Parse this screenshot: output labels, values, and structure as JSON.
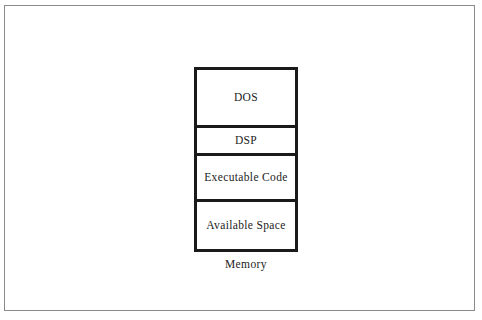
{
  "figure": {
    "caption": "Memory",
    "border_color": "#8a8a8a",
    "background_color": "#ffffff"
  },
  "memory_diagram": {
    "name": "memory-map",
    "box_border_color": "#1a1a1a",
    "text_color": "#1c1c1c",
    "segments": [
      {
        "label": "DOS",
        "height_px": 58,
        "order": 1
      },
      {
        "label": "DSP",
        "height_px": 28,
        "order": 2
      },
      {
        "label": "Executable Code",
        "height_px": 46,
        "order": 3
      },
      {
        "label": "Available Space",
        "height_px": 47,
        "order": 4
      }
    ]
  }
}
